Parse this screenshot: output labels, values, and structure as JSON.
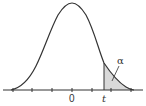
{
  "figure": {
    "type": "t-distribution density with right tail shaded",
    "curve": {
      "center_label": "0",
      "critical_value_label": "t",
      "tail_area_label": "α"
    },
    "axis": {
      "tick_count": 7,
      "labels": [
        "0",
        "t"
      ]
    },
    "colors": {
      "curve": "#333333",
      "axis": "#333333",
      "shade": "#d9d9d9",
      "background": "#ffffff"
    }
  }
}
